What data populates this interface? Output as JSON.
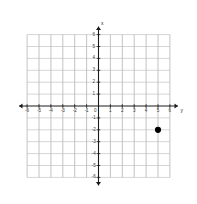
{
  "figure": {
    "kind": "coordinate-plane",
    "background_color": "#ffffff",
    "grid_color": "#b8b8b8",
    "axis_color": "#1a1a1a",
    "label_color": "#3b3b3b",
    "point_color": "#000000"
  },
  "axes": {
    "vertical_axis_name": "x",
    "horizontal_axis_name": "y",
    "origin_label": "0"
  },
  "chart_data": {
    "type": "scatter",
    "title": "",
    "xlabel": "y",
    "ylabel": "x",
    "xlim": [
      -6.8,
      6.8
    ],
    "ylim": [
      -6.8,
      6.8
    ],
    "grid": true,
    "legend": null,
    "x_tick_labels": [
      "-6",
      "-5",
      "-4",
      "-3",
      "-2",
      "-1",
      "0",
      "1",
      "2",
      "3",
      "4",
      "5",
      "6"
    ],
    "x_ticks": [
      -6,
      -5,
      -4,
      -3,
      -2,
      -1,
      0,
      1,
      2,
      3,
      4,
      5,
      6
    ],
    "y_tick_labels": [
      "6",
      "5",
      "4",
      "3",
      "2",
      "1",
      "-1",
      "-2",
      "-3",
      "-4",
      "-5",
      "-6"
    ],
    "y_ticks": [
      6,
      5,
      4,
      3,
      2,
      1,
      -1,
      -2,
      -3,
      -4,
      -5,
      -6
    ],
    "series": [
      {
        "name": "plotted-point",
        "marker": "filled-circle",
        "color": "#000000",
        "points": [
          {
            "x": 5,
            "y": -2,
            "label": "(5, -2)"
          }
        ]
      }
    ]
  }
}
